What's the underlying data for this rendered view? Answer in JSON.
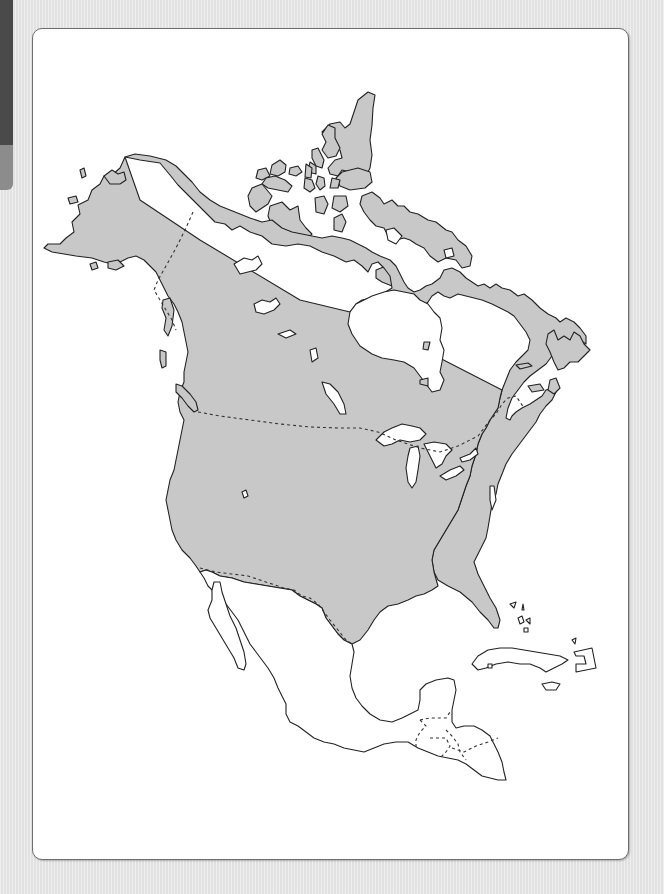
{
  "page": {
    "type": "outline-map-printable",
    "labels_visible": false
  },
  "colors": {
    "background": "#e6e6e6",
    "frame_fill": "#ffffff",
    "frame_border": "#6e6e6e",
    "highlighted_land": "#c8c8c8",
    "other_land": "#ffffff",
    "outline": "#222222",
    "side_tab_dark": "#4a4a4a",
    "side_tab_light": "#8c8c8c"
  },
  "map": {
    "highlighted_regions": [
      "Alaska",
      "Canada",
      "Contiguous United States",
      "Canadian Arctic Archipelago",
      "Newfoundland"
    ],
    "unhighlighted_regions": [
      "Mexico",
      "Central America",
      "Cuba",
      "Caribbean islands",
      "Greenland (not shown)"
    ],
    "water_bodies_shown": [
      "Hudson Bay",
      "Great Lakes",
      "Gulf of Mexico",
      "Gulf of St. Lawrence",
      "Great Bear Lake",
      "Great Slave Lake",
      "Lake Winnipeg",
      "Great Salt Lake"
    ],
    "dashed_borders": [
      "Alaska–Canada",
      "Canada–United States",
      "United States–Mexico",
      "Central American borders"
    ]
  }
}
